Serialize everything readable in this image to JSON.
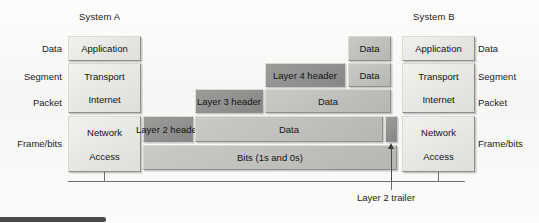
{
  "systems": {
    "left_title": "System A",
    "right_title": "System B"
  },
  "left_labels": [
    {
      "text": "Data"
    },
    {
      "text": "Segment"
    },
    {
      "text": "Packet"
    },
    {
      "text": "Frame/bits"
    }
  ],
  "right_labels": [
    {
      "text": "Data"
    },
    {
      "text": "Segment"
    },
    {
      "text": "Packet"
    },
    {
      "text": "Frame/bits"
    }
  ],
  "left_stack": {
    "application": "Application",
    "transport": "Transport",
    "internet": "Internet",
    "network": "Network",
    "access": "Access"
  },
  "right_stack": {
    "application": "Application",
    "transport": "Transport",
    "internet": "Internet",
    "network": "Network",
    "access": "Access"
  },
  "encapsulation": {
    "row_app": {
      "data": "Data"
    },
    "row_transport": {
      "header": "Layer 4 header",
      "data": "Data"
    },
    "row_internet": {
      "header": "Layer 3 header",
      "data": "Data"
    },
    "row_network": {
      "header": "Layer 2 header",
      "data": "Data",
      "trailer": ""
    },
    "row_bits": {
      "bits": "Bits (1s and 0s)"
    }
  },
  "callouts": {
    "layer2_trailer": "Layer 2 trailer"
  },
  "colors": {
    "box_light": "#e6e6e3",
    "box_mid": "#bfbfbb",
    "box_dark": "#919190",
    "border": "#8e8e8e",
    "text": "#141414",
    "rule": "#6f6f6f",
    "caption_bar": "#4a4a4a"
  }
}
